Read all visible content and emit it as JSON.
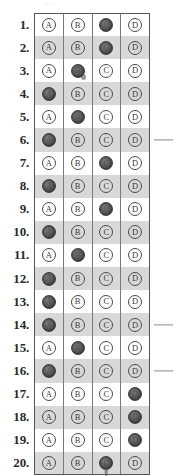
{
  "sheet": {
    "title": "Answer Sheet Bubble Grid",
    "top_fragment": "....",
    "option_labels": [
      "A",
      "B",
      "C",
      "D"
    ],
    "shaded_row_color": "#d8d8d8",
    "filled_bubble_color": "#4f4f4f",
    "border_color": "#555555",
    "rows": [
      {
        "number": "1.",
        "marked": "C",
        "shaded": false,
        "margin_mark": false
      },
      {
        "number": "2.",
        "marked": "C",
        "shaded": true,
        "margin_mark": false
      },
      {
        "number": "3.",
        "marked": "B",
        "shaded": false,
        "margin_mark": false
      },
      {
        "number": "4.",
        "marked": "A",
        "shaded": true,
        "margin_mark": false
      },
      {
        "number": "5.",
        "marked": "B",
        "shaded": false,
        "margin_mark": false
      },
      {
        "number": "6.",
        "marked": "A",
        "shaded": true,
        "margin_mark": true
      },
      {
        "number": "7.",
        "marked": "C",
        "shaded": false,
        "margin_mark": false
      },
      {
        "number": "8.",
        "marked": "A",
        "shaded": true,
        "margin_mark": false
      },
      {
        "number": "9.",
        "marked": "C",
        "shaded": false,
        "margin_mark": false
      },
      {
        "number": "10.",
        "marked": "A",
        "shaded": true,
        "margin_mark": false
      },
      {
        "number": "11.",
        "marked": "B",
        "shaded": false,
        "margin_mark": false
      },
      {
        "number": "12.",
        "marked": "A",
        "shaded": true,
        "margin_mark": false
      },
      {
        "number": "13.",
        "marked": "A",
        "shaded": false,
        "margin_mark": false
      },
      {
        "number": "14.",
        "marked": "A",
        "shaded": true,
        "margin_mark": true
      },
      {
        "number": "15.",
        "marked": "B",
        "shaded": false,
        "margin_mark": false
      },
      {
        "number": "16.",
        "marked": "A",
        "shaded": true,
        "margin_mark": true
      },
      {
        "number": "17.",
        "marked": "D",
        "shaded": false,
        "margin_mark": false
      },
      {
        "number": "18.",
        "marked": "D",
        "shaded": true,
        "margin_mark": false
      },
      {
        "number": "19.",
        "marked": "D",
        "shaded": false,
        "margin_mark": false
      },
      {
        "number": "20.",
        "marked": "C",
        "shaded": true,
        "margin_mark": false
      }
    ]
  }
}
